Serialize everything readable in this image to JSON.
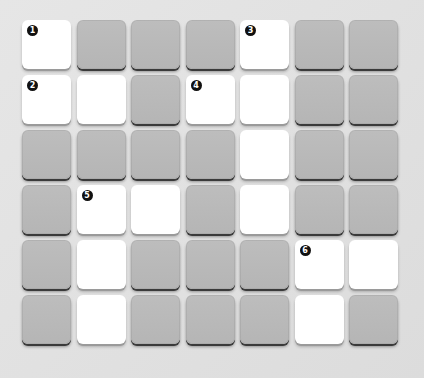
{
  "puzzle": {
    "type": "crossword-grid",
    "rows": 6,
    "cols": 7,
    "colors": {
      "background": "#e0e0e0",
      "open_cell": "#ffffff",
      "blocked_cell": "#b8b8b8",
      "badge": "#111111"
    },
    "grid": [
      [
        "W",
        "G",
        "G",
        "G",
        "W",
        "G",
        "G"
      ],
      [
        "W",
        "W",
        "G",
        "W",
        "W",
        "G",
        "G"
      ],
      [
        "G",
        "G",
        "G",
        "G",
        "W",
        "G",
        "G"
      ],
      [
        "G",
        "W",
        "W",
        "G",
        "W",
        "G",
        "G"
      ],
      [
        "G",
        "W",
        "G",
        "G",
        "G",
        "W",
        "W"
      ],
      [
        "G",
        "W",
        "G",
        "G",
        "G",
        "W",
        "G"
      ]
    ],
    "clue_numbers": [
      {
        "row": 0,
        "col": 0,
        "number": "1"
      },
      {
        "row": 1,
        "col": 0,
        "number": "2"
      },
      {
        "row": 0,
        "col": 4,
        "number": "3"
      },
      {
        "row": 1,
        "col": 3,
        "number": "4"
      },
      {
        "row": 3,
        "col": 1,
        "number": "5"
      },
      {
        "row": 4,
        "col": 5,
        "number": "6"
      }
    ]
  }
}
